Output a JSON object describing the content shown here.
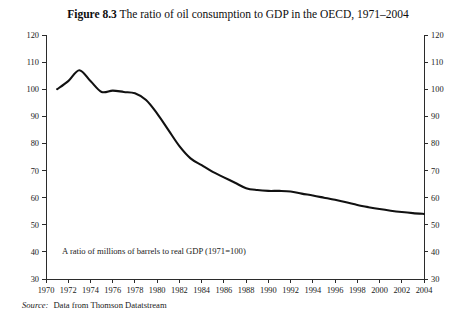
{
  "figure": {
    "label": "Figure 8.3",
    "title": "The ratio of oil consumption to GDP in the OECD, 1971–2004",
    "source_label": "Source:",
    "source_text": "Data from Thomson Datatstream"
  },
  "chart_data": {
    "type": "line",
    "title": "The ratio of oil consumption to GDP in the OECD, 1971–2004",
    "subtitle": "",
    "xlabel": "",
    "ylabel": "",
    "annotation": "A ratio of millions of barrels to real GDP (1971=100)",
    "grid": false,
    "legend": "none",
    "xlim": [
      1970,
      2004
    ],
    "ylim": [
      30,
      120
    ],
    "ytick_step": 10,
    "xtick_step": 2,
    "y_axis_both_sides": true,
    "yticks": [
      30,
      40,
      50,
      60,
      70,
      80,
      90,
      100,
      110,
      120
    ],
    "xticks": [
      1970,
      1972,
      1974,
      1976,
      1978,
      1980,
      1982,
      1984,
      1986,
      1988,
      1990,
      1992,
      1994,
      1996,
      1998,
      2000,
      2002,
      2004
    ],
    "xticklabels": [
      "1970",
      "1972",
      "1974",
      "1976",
      "1978",
      "1980",
      "1982",
      "1984",
      "1986",
      "1988",
      "1990",
      "1992",
      "1994",
      "1996",
      "1998",
      "2000",
      "2002",
      "2004"
    ],
    "yticklabels": [
      "30",
      "40",
      "50",
      "60",
      "70",
      "80",
      "90",
      "100",
      "110",
      "120"
    ],
    "series": [
      {
        "name": "Oil consumption to GDP ratio (1971=100)",
        "color": "#111111",
        "x": [
          1971,
          1972,
          1973,
          1974,
          1975,
          1976,
          1977,
          1978,
          1979,
          1980,
          1981,
          1982,
          1983,
          1984,
          1985,
          1986,
          1987,
          1988,
          1989,
          1990,
          1991,
          1992,
          1993,
          1994,
          1995,
          1996,
          1997,
          1998,
          1999,
          2000,
          2001,
          2002,
          2003,
          2004
        ],
        "values": [
          100,
          103,
          107,
          103,
          99,
          99.5,
          99,
          98.5,
          96,
          91,
          85,
          79,
          74.5,
          72,
          69.5,
          67.5,
          65.5,
          63.5,
          62.8,
          62.5,
          62.5,
          62.3,
          61.5,
          60.8,
          60,
          59.2,
          58.3,
          57.3,
          56.5,
          55.8,
          55.2,
          54.7,
          54.3,
          54
        ]
      }
    ]
  }
}
